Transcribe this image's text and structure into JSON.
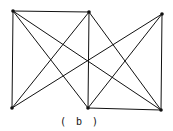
{
  "caption": "( b )",
  "diagram": {
    "type": "graph",
    "stroke_color": "#111111",
    "nodes": [
      {
        "id": "TL",
        "x": 13,
        "y": 11
      },
      {
        "id": "TM",
        "x": 89,
        "y": 12
      },
      {
        "id": "TR",
        "x": 162,
        "y": 14
      },
      {
        "id": "BL",
        "x": 12,
        "y": 108
      },
      {
        "id": "BM",
        "x": 88,
        "y": 108
      },
      {
        "id": "BR",
        "x": 161,
        "y": 110
      }
    ],
    "edges": [
      [
        "TL",
        "TM"
      ],
      [
        "TL",
        "BL"
      ],
      [
        "TL",
        "BM"
      ],
      [
        "TL",
        "BR"
      ],
      [
        "TM",
        "BM"
      ],
      [
        "TM",
        "BL"
      ],
      [
        "TM",
        "BR"
      ],
      [
        "TR",
        "BR"
      ],
      [
        "TR",
        "BL"
      ],
      [
        "TR",
        "BM"
      ],
      [
        "BM",
        "BR"
      ]
    ]
  }
}
